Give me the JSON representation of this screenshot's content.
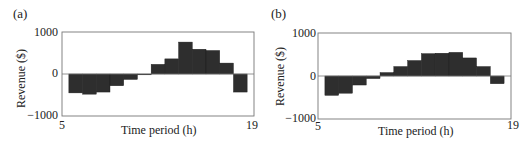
{
  "chart_data": [
    {
      "panel_label": "(a)",
      "type": "bar",
      "title": "",
      "xlabel": "Time period (h)",
      "ylabel": "Revenue ($)",
      "xlim": [
        5,
        19
      ],
      "ylim": [
        -1000,
        1000
      ],
      "x_ticks": [
        "5",
        "19"
      ],
      "y_ticks": [
        "1000",
        "0",
        "−1000"
      ],
      "grid": false,
      "legend": null,
      "categories": [
        6,
        7,
        8,
        9,
        10,
        11,
        12,
        13,
        14,
        15,
        16,
        17,
        18
      ],
      "values": [
        -450,
        -480,
        -430,
        -280,
        -130,
        -20,
        230,
        360,
        760,
        590,
        560,
        260,
        -430
      ],
      "bar_color": "#2e2e2e"
    },
    {
      "panel_label": "(b)",
      "type": "bar",
      "title": "",
      "xlabel": "Time period (h)",
      "ylabel": "Revenue ($)",
      "xlim": [
        5,
        19
      ],
      "ylim": [
        -1000,
        1000
      ],
      "x_ticks": [
        "5",
        "19"
      ],
      "y_ticks": [
        "1000",
        "0",
        "−1000"
      ],
      "grid": false,
      "legend": null,
      "categories": [
        6,
        7,
        8,
        9,
        10,
        11,
        12,
        13,
        14,
        15,
        16,
        17,
        18
      ],
      "values": [
        -450,
        -400,
        -210,
        -60,
        80,
        220,
        360,
        520,
        530,
        550,
        420,
        220,
        -180
      ],
      "bar_color": "#2e2e2e"
    }
  ],
  "panels": [
    {
      "label": "(a)",
      "ylabel": "Revenue ($)",
      "xlabel": "Time period (h)",
      "ytick_top": "1000",
      "ytick_mid": "0",
      "ytick_bot": "−1000",
      "xtick_left": "5",
      "xtick_right": "19"
    },
    {
      "label": "(b)",
      "ylabel": "Revenue ($)",
      "xlabel": "Time period (h)",
      "ytick_top": "1000",
      "ytick_mid": "0",
      "ytick_bot": "−1000",
      "xtick_left": "5",
      "xtick_right": "19"
    }
  ]
}
